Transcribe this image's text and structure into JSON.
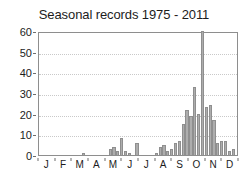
{
  "chart_data": {
    "type": "bar",
    "title": "Seasonal records 1975 - 2011",
    "subtitle": "",
    "xlabel": "",
    "ylabel": "",
    "ylim": [
      0,
      60
    ],
    "yticks": [
      0,
      10,
      20,
      30,
      40,
      50,
      60
    ],
    "ytick_labels": [
      "0",
      "10",
      "20",
      "30",
      "40",
      "50",
      "60"
    ],
    "grid": true,
    "grid_axis": "y",
    "legend": false,
    "legend_position": "none",
    "bar_color": "#adadad",
    "bar_edge_color": "#8f8f8f",
    "axis_color": "#8e8e8e",
    "grid_color": "#c9c9c9",
    "text_color": "#1c1c1c",
    "xlabel_ticks": [
      "J",
      "F",
      "M",
      "A",
      "M",
      "J",
      "J",
      "A",
      "S",
      "O",
      "N",
      "D"
    ],
    "xtick_names": [
      "January",
      "February",
      "March",
      "April",
      "May",
      "June",
      "July",
      "August",
      "September",
      "October",
      "November",
      "December"
    ],
    "x_unit": "week of year",
    "n_bins": 52,
    "categories": [
      "W1",
      "W2",
      "W3",
      "W4",
      "W5",
      "W6",
      "W7",
      "W8",
      "W9",
      "W10",
      "W11",
      "W12",
      "W13",
      "W14",
      "W15",
      "W16",
      "W17",
      "W18",
      "W19",
      "W20",
      "W21",
      "W22",
      "W23",
      "W24",
      "W25",
      "W26",
      "W27",
      "W28",
      "W29",
      "W30",
      "W31",
      "W32",
      "W33",
      "W34",
      "W35",
      "W36",
      "W37",
      "W38",
      "W39",
      "W40",
      "W41",
      "W42",
      "W43",
      "W44",
      "W45",
      "W46",
      "W47",
      "W48",
      "W49",
      "W50",
      "W51",
      "W52"
    ],
    "values": [
      0,
      0,
      0,
      0,
      0,
      0,
      0,
      0,
      0,
      0,
      0,
      1,
      0,
      0,
      0,
      0,
      0,
      0,
      3,
      4,
      2,
      8,
      2,
      1,
      0,
      6,
      0,
      0,
      0,
      0,
      1,
      4,
      5,
      2,
      3,
      6,
      7,
      15,
      22,
      19,
      33,
      20,
      60,
      23,
      24,
      17,
      6,
      7,
      7,
      2,
      3,
      0
    ]
  }
}
